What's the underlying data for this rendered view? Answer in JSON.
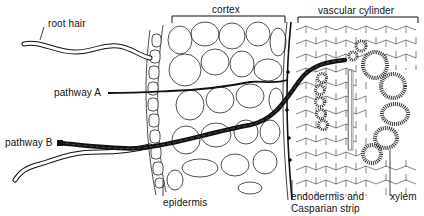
{
  "figure": {
    "colors": {
      "ink": "#111111",
      "background": "#ffffff",
      "xylem_wall": "#555555"
    }
  },
  "labels": {
    "root_hair": "root hair",
    "cortex": "cortex",
    "vascular_cylinder": "vascular cylinder",
    "pathway_a": "pathway A",
    "pathway_b": "pathway B",
    "epidermis": "epidermis",
    "endodermis_line1": "endodermis and",
    "endodermis_line2": "Casparian strip",
    "xylem": "xylem"
  }
}
